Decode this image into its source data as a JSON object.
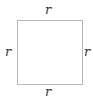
{
  "diagram": {
    "shape": "square",
    "labels": {
      "top": "r",
      "left": "r",
      "right": "r",
      "bottom": "r"
    },
    "colors": {
      "stroke": "#b8b8b8",
      "text": "#333333"
    }
  }
}
